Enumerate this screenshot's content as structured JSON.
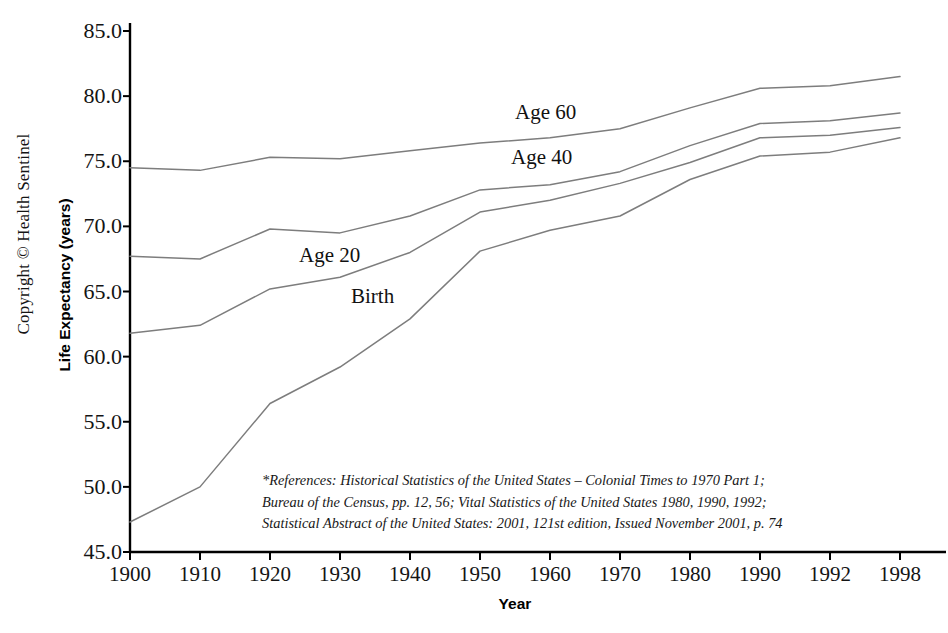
{
  "copyright": "Copyright © Health Sentinel",
  "chart_data": {
    "type": "line",
    "title": "",
    "xlabel": "Year",
    "ylabel": "Life Expectancy (years)",
    "categories": [
      "1900",
      "1910",
      "1920",
      "1930",
      "1940",
      "1950",
      "1960",
      "1970",
      "1980",
      "1990",
      "1992",
      "1998"
    ],
    "x_tick_labels": [
      "1900",
      "1910",
      "1920",
      "1930",
      "1940",
      "1950",
      "1960",
      "1970",
      "1980",
      "1990",
      "1992",
      "1998"
    ],
    "y_tick_labels": [
      "85.0",
      "80.0",
      "75.0",
      "70.0",
      "65.0",
      "60.0",
      "55.0",
      "50.0",
      "45.0"
    ],
    "y_ticks": [
      85.0,
      80.0,
      75.0,
      70.0,
      65.0,
      60.0,
      55.0,
      50.0,
      45.0
    ],
    "ylim": [
      45.0,
      85.0
    ],
    "grid": false,
    "legend_position": "inline-labels",
    "line_color": "#7d7d7d",
    "axis_color": "#000000",
    "series": [
      {
        "name": "Age 60",
        "label": "Age 60",
        "values": [
          74.5,
          74.3,
          75.3,
          75.2,
          75.8,
          76.4,
          76.8,
          77.5,
          79.1,
          80.6,
          80.8,
          81.5
        ]
      },
      {
        "name": "Age 40",
        "label": "Age 40",
        "values": [
          67.7,
          67.5,
          69.8,
          69.5,
          70.8,
          72.8,
          73.2,
          74.2,
          76.2,
          77.9,
          78.1,
          78.7
        ]
      },
      {
        "name": "Age 20",
        "label": "Age 20",
        "values": [
          61.8,
          62.4,
          65.2,
          66.1,
          68.0,
          71.1,
          72.0,
          73.3,
          74.9,
          76.8,
          77.0,
          77.6
        ]
      },
      {
        "name": "Birth",
        "label": "Birth",
        "values": [
          47.3,
          50.0,
          56.4,
          59.2,
          62.9,
          68.1,
          69.7,
          70.8,
          73.6,
          75.4,
          75.7,
          76.8
        ]
      }
    ],
    "series_labels": [
      {
        "text": "Age 60",
        "x": 512,
        "y": 100
      },
      {
        "text": "Age 40",
        "x": 508,
        "y": 145
      },
      {
        "text": "Age 20",
        "x": 296,
        "y": 243
      },
      {
        "text": "Birth",
        "x": 348,
        "y": 284
      }
    ]
  },
  "footnote": {
    "line1": "*References: Historical Statistics of the United States – Colonial Times to 1970 Part 1;",
    "line2": "Bureau of the Census, pp. 12, 56; Vital Statistics of the United States 1980, 1990, 1992;",
    "line3": "Statistical Abstract of the United States: 2001, 121st edition, Issued November 2001, p. 74"
  }
}
